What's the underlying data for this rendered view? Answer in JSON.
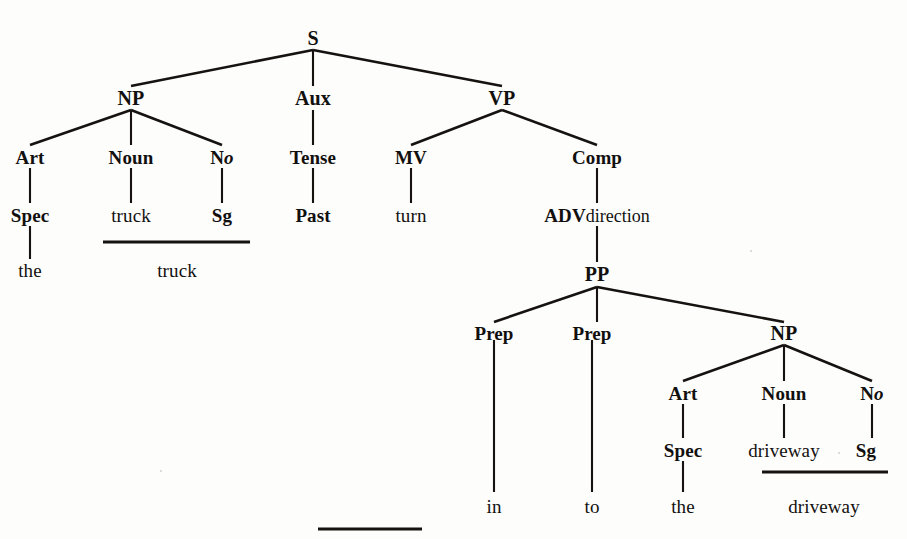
{
  "diagram": {
    "kind": "phrase-structure-tree",
    "sentence": "the truck turned into the driveway",
    "header_faint": "",
    "nodes": {
      "s": "S",
      "np_subj": "NP",
      "aux": "Aux",
      "vp": "VP",
      "art1": "Art",
      "noun1": "Noun",
      "no1_main": "N",
      "no1_sup": "o",
      "tense": "Tense",
      "mv": "MV",
      "comp": "Comp",
      "spec1": "Spec",
      "truck_lex": "truck",
      "sg1": "Sg",
      "past": "Past",
      "turn": "turn",
      "adv_main": "ADV",
      "adv_sub": "direction",
      "the1": "the",
      "truck_surface": "truck",
      "pp": "PP",
      "prep1": "Prep",
      "prep2": "Prep",
      "np_obj": "NP",
      "art2": "Art",
      "noun2": "Noun",
      "no2_main": "N",
      "no2_sup": "o",
      "spec2": "Spec",
      "driveway_lex": "driveway",
      "sg2": "Sg",
      "in": "in",
      "to": "to",
      "the2": "the",
      "driveway_surface": "driveway"
    },
    "colors": {
      "ink": "#15120f",
      "paper": "#fdfdfc"
    }
  }
}
